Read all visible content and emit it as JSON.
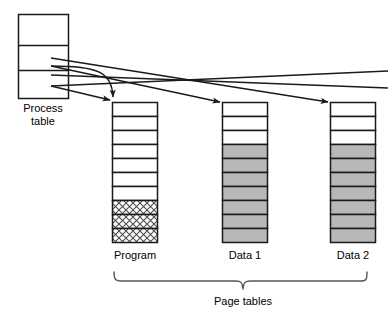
{
  "diagram": {
    "colors": {
      "stroke": "#1a1a1a",
      "fill_empty": "#ffffff",
      "fill_used": "#b8b8b8",
      "fill_hatch": "#ffffff",
      "hatch_line": "#4d4d4d",
      "background": "#ffffff",
      "text": "#000000"
    },
    "process_table": {
      "label_line1": "Process",
      "label_line2": "table",
      "rows": 3,
      "pointer_count": 4
    },
    "page_tables": [
      {
        "name": "program-page-table",
        "label": "Program",
        "cells": 10,
        "cell_states": [
          "empty",
          "empty",
          "empty",
          "empty",
          "empty",
          "empty",
          "empty",
          "hatched",
          "hatched",
          "hatched"
        ]
      },
      {
        "name": "data1-page-table",
        "label": "Data 1",
        "cells": 10,
        "cell_states": [
          "empty",
          "empty",
          "empty",
          "used",
          "used",
          "used",
          "used",
          "used",
          "used",
          "used"
        ]
      },
      {
        "name": "data2-page-table",
        "label": "Data 2",
        "cells": 10,
        "cell_states": [
          "empty",
          "empty",
          "empty",
          "used",
          "used",
          "used",
          "used",
          "used",
          "used",
          "used"
        ]
      }
    ],
    "brace_label": "Page tables"
  }
}
